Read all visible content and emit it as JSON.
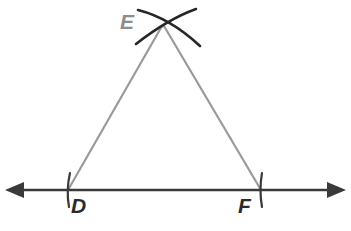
{
  "figure": {
    "background_color": "#ffffff"
  },
  "labels": {
    "apex": "E",
    "left_base": "D",
    "right_base": "F"
  },
  "colors": {
    "triangle_legs": "#9a9a9a",
    "baseline": "#3a3a3a",
    "arcs": "#262626",
    "tick_marks": "#3a3a3a",
    "label_dark": "#2b2b2b",
    "label_gray": "#8d8d8d"
  },
  "geometry": {
    "baseline": {
      "y": 190,
      "x_start": 6,
      "x_end": 345,
      "stroke_width": 2.4,
      "left_arrowhead": "arrow-left",
      "right_arrowhead": "arrow-right"
    },
    "points": {
      "D": {
        "x": 68,
        "y": 190
      },
      "F": {
        "x": 261,
        "y": 190
      },
      "E": {
        "x": 163,
        "y": 24
      }
    },
    "tick_marks": [
      {
        "name": "tick-D",
        "x": 68,
        "y_top": 173,
        "y_bottom": 207
      },
      {
        "name": "tick-F",
        "x": 261,
        "y_top": 173,
        "y_bottom": 207
      }
    ],
    "legs": [
      {
        "name": "leg-DE",
        "from": "D",
        "to": "E",
        "stroke_width": 2.2
      },
      {
        "name": "leg-EF",
        "from": "E",
        "to": "F",
        "stroke_width": 2.2
      }
    ],
    "construction_arcs": [
      {
        "name": "arc-from-D",
        "description": "compass arc centered at D sweeping through apex toward upper right",
        "path": "M 138 10 Q 170 18 200 46",
        "stroke_width": 2.6
      },
      {
        "name": "arc-from-F",
        "description": "compass arc centered at F sweeping through apex toward lower left",
        "path": "M 196 9 Q 168 19 136 44",
        "stroke_width": 2.6
      }
    ]
  }
}
